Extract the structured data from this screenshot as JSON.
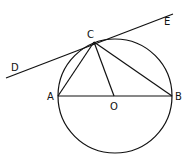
{
  "diagram": {
    "labels": {
      "D": "D",
      "E": "E",
      "C": "C",
      "A": "A",
      "B": "B",
      "O": "O"
    }
  }
}
